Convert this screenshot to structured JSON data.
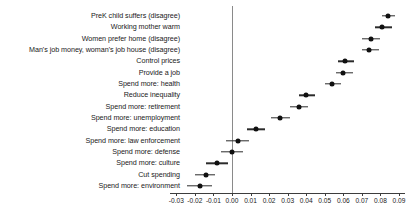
{
  "chart_data": {
    "type": "scatter",
    "title": "",
    "subtitle": "",
    "xlabel": "",
    "ylabel": "",
    "orientation": "horizontal",
    "plot_kind": "coefficient-forest-plot",
    "xlim": [
      -0.035,
      0.095
    ],
    "xticks": [
      -0.03,
      -0.02,
      -0.01,
      0.0,
      0.01,
      0.02,
      0.03,
      0.04,
      0.05,
      0.06,
      0.07,
      0.08,
      0.09
    ],
    "xticklabels": [
      "-0.03",
      "-0.02",
      "-0.01",
      "0.00",
      "0.01",
      "0.02",
      "0.03",
      "0.04",
      "0.05",
      "0.06",
      "0.07",
      "0.08",
      "0.09"
    ],
    "grid": false,
    "legend": null,
    "reference_line": {
      "x": 0.0,
      "color": "#8a8a8a"
    },
    "marker_color": "#101010",
    "error_bar_color": "#2b2b2b",
    "categories": [
      "PreK child suffers (disagree)",
      "Working mother warm",
      "Women prefer home (disagree)",
      "Man's job money, woman's job house (disagree)",
      "Control prices",
      "Provide a job",
      "Spend more: health",
      "Reduce inequality",
      "Spend more: retirement",
      "Spend more: unemployment",
      "Spend more: education",
      "Spend more: law enforcement",
      "Spend more: defense",
      "Spend more: culture",
      "Cut spending",
      "Spend more: environment"
    ],
    "values": [
      0.084,
      0.081,
      0.075,
      0.074,
      0.061,
      0.06,
      0.054,
      0.04,
      0.036,
      0.026,
      0.013,
      0.003,
      0.0,
      -0.008,
      -0.014,
      -0.017
    ],
    "ci_low": [
      0.081,
      0.077,
      0.07,
      0.07,
      0.057,
      0.056,
      0.05,
      0.036,
      0.031,
      0.021,
      0.008,
      -0.003,
      -0.006,
      -0.014,
      -0.02,
      -0.024
    ],
    "ci_high": [
      0.088,
      0.086,
      0.08,
      0.079,
      0.066,
      0.065,
      0.059,
      0.045,
      0.041,
      0.031,
      0.018,
      0.009,
      0.006,
      -0.002,
      -0.009,
      -0.011
    ]
  }
}
